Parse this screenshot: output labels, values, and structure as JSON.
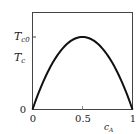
{
  "chart_data": {
    "type": "line",
    "title": "",
    "xlabel": "c_A",
    "ylabel": "",
    "xlim": [
      0,
      1
    ],
    "ylim": [
      0,
      1.3
    ],
    "x_ticks": [
      "0",
      "0.5",
      "1"
    ],
    "y_ticks": [
      "0",
      "T_c0"
    ],
    "y_annotations": [
      "T_c"
    ],
    "grid": false,
    "legend": null,
    "series": [
      {
        "name": "T_c",
        "x": [
          0,
          0.1,
          0.2,
          0.3,
          0.4,
          0.5,
          0.6,
          0.7,
          0.8,
          0.9,
          1.0
        ],
        "values": [
          0,
          0.36,
          0.64,
          0.84,
          0.96,
          1.0,
          0.96,
          0.84,
          0.64,
          0.36,
          0
        ]
      }
    ]
  },
  "labels": {
    "x_tick_0": "0",
    "x_tick_mid": "0.5",
    "x_tick_1": "1",
    "y_tick_0": "0",
    "y_tick_tc0_main": "T",
    "y_tick_tc0_sub": "c0",
    "y_curve_main": "T",
    "y_curve_sub": "c",
    "x_axis_main": "c",
    "x_axis_sub": "A"
  }
}
